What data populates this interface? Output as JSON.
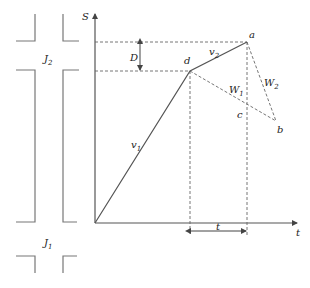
{
  "diagram": {
    "type": "space-time trajectory diagram with intersections",
    "axes": {
      "y_label": "S",
      "x_label": "t"
    },
    "intersections": [
      {
        "id": "J2",
        "label": "J",
        "sub": "2"
      },
      {
        "id": "J1",
        "label": "J",
        "sub": "1"
      }
    ],
    "points": {
      "a": "a",
      "b": "b",
      "c": "c",
      "d": "d"
    },
    "segments": {
      "v1": {
        "label": "v",
        "sub": "1"
      },
      "v2": {
        "label": "v",
        "sub": "2"
      },
      "W1": {
        "label": "W",
        "sub": "1"
      },
      "W2": {
        "label": "W",
        "sub": "2"
      }
    },
    "dimensions": {
      "D": "D",
      "t": "t"
    },
    "colors": {
      "line": "#555555",
      "dash": "#666666"
    }
  }
}
